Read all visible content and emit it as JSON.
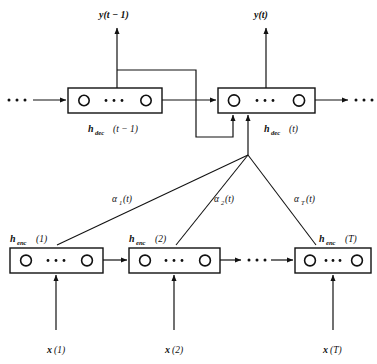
{
  "figure": {
    "kind": "encoder-decoder-attention-diagram",
    "title": "",
    "background_color": "#ffffff",
    "line_color": "#111111",
    "width": 377,
    "height": 364
  },
  "outputs": [
    {
      "id": "y-t-minus-1",
      "label": "y(t − 1)",
      "base": "y",
      "arg": "(t − 1)"
    },
    {
      "id": "y-t",
      "label": "y(t)",
      "base": "y",
      "arg": "(t)"
    }
  ],
  "decoder": {
    "row_label": "decoder",
    "ellipsis_left": "· · ·",
    "ellipsis_right": "· · ·",
    "cells": [
      {
        "id": "h-dec-t-minus-1",
        "base": "h",
        "sub": "dec",
        "arg": "(t − 1)",
        "inner_dots": "· · ·"
      },
      {
        "id": "h-dec-t",
        "base": "h",
        "sub": "dec",
        "arg": "(t)",
        "inner_dots": "· · ·"
      }
    ]
  },
  "attention": {
    "weights": [
      {
        "id": "alpha-1",
        "base": "α",
        "sub": "1",
        "arg": "(t)"
      },
      {
        "id": "alpha-2",
        "base": "α",
        "sub": "2",
        "arg": "(t)"
      },
      {
        "id": "alpha-T",
        "base": "α",
        "sub": "T",
        "arg": "(t)"
      }
    ]
  },
  "encoder": {
    "row_label": "encoder",
    "middle_ellipsis": "· · ·",
    "cells": [
      {
        "id": "h-enc-1",
        "base": "h",
        "sub": "enc",
        "arg": "(1)",
        "inner_dots": "· · ·"
      },
      {
        "id": "h-enc-2",
        "base": "h",
        "sub": "enc",
        "arg": "(2)",
        "inner_dots": "· · ·"
      },
      {
        "id": "h-enc-T",
        "base": "h",
        "sub": "enc",
        "arg": "(T)",
        "inner_dots": "· · ·"
      }
    ]
  },
  "inputs": [
    {
      "id": "x-1",
      "base": "x",
      "arg": "(1)"
    },
    {
      "id": "x-2",
      "base": "x",
      "arg": "(2)"
    },
    {
      "id": "x-T",
      "base": "x",
      "arg": "(T)"
    }
  ]
}
